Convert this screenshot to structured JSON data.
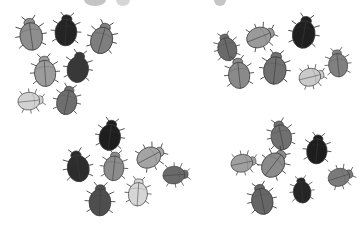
{
  "figure": {
    "background_color": "#ffffff",
    "width": 359,
    "height": 225,
    "outline_color": "#3a3a3a",
    "shade_palette": {
      "near_black": "#1c1c1c",
      "very_dark": "#2e2e2e",
      "dark": "#4a4a4a",
      "mid_dark": "#5f5f5f",
      "mid": "#767676",
      "mid_light": "#8e8e8e",
      "light": "#a9a9a9",
      "very_light": "#c4c4c4",
      "pale": "#dcdcdc",
      "near_white": "#ececec"
    }
  },
  "clusters": [
    {
      "name": "top-left-cluster",
      "label": "Cluster A",
      "count": 7,
      "origin": {
        "x": 0,
        "y": 0
      },
      "beetles": [
        {
          "id": "a1",
          "x": 14,
          "y": 16,
          "w": 34,
          "h": 38,
          "rot": -8,
          "shade": "#8e8e8e"
        },
        {
          "id": "a2",
          "x": 50,
          "y": 12,
          "w": 32,
          "h": 38,
          "rot": 4,
          "shade": "#242424"
        },
        {
          "id": "a3",
          "x": 86,
          "y": 20,
          "w": 32,
          "h": 38,
          "rot": 16,
          "shade": "#7e7e7e"
        },
        {
          "id": "a4",
          "x": 28,
          "y": 54,
          "w": 34,
          "h": 36,
          "rot": -4,
          "shade": "#9c9c9c"
        },
        {
          "id": "a5",
          "x": 62,
          "y": 50,
          "w": 32,
          "h": 36,
          "rot": 8,
          "shade": "#383838"
        },
        {
          "id": "a6",
          "x": 10,
          "y": 86,
          "w": 40,
          "h": 30,
          "rot": 84,
          "shade": "#d2d2d2"
        },
        {
          "id": "a7",
          "x": 52,
          "y": 84,
          "w": 30,
          "h": 34,
          "rot": 12,
          "shade": "#6e6e6e"
        }
      ]
    },
    {
      "name": "top-right-cluster",
      "label": "Cluster B",
      "count": 7,
      "origin": {
        "x": 205,
        "y": 0
      },
      "beetles": [
        {
          "id": "b1",
          "x": 212,
          "y": 32,
          "w": 30,
          "h": 32,
          "rot": -14,
          "shade": "#6a6a6a"
        },
        {
          "id": "b2",
          "x": 242,
          "y": 20,
          "w": 36,
          "h": 34,
          "rot": 68,
          "shade": "#9a9a9a"
        },
        {
          "id": "b3",
          "x": 286,
          "y": 14,
          "w": 36,
          "h": 38,
          "rot": 10,
          "shade": "#1f1f1f"
        },
        {
          "id": "b4",
          "x": 222,
          "y": 56,
          "w": 34,
          "h": 36,
          "rot": -6,
          "shade": "#8a8a8a"
        },
        {
          "id": "b5",
          "x": 258,
          "y": 50,
          "w": 34,
          "h": 38,
          "rot": 6,
          "shade": "#707070"
        },
        {
          "id": "b6",
          "x": 294,
          "y": 62,
          "w": 34,
          "h": 30,
          "rot": 76,
          "shade": "#cacaca"
        },
        {
          "id": "b7",
          "x": 324,
          "y": 44,
          "w": 28,
          "h": 40,
          "rot": -6,
          "shade": "#808080"
        }
      ]
    },
    {
      "name": "bottom-left-cluster",
      "label": "Cluster C",
      "count": 7,
      "origin": {
        "x": 55,
        "y": 112
      },
      "beetles": [
        {
          "id": "c1",
          "x": 94,
          "y": 118,
          "w": 32,
          "h": 36,
          "rot": 8,
          "shade": "#1e1e1e"
        },
        {
          "id": "c2",
          "x": 62,
          "y": 148,
          "w": 32,
          "h": 38,
          "rot": -10,
          "shade": "#2c2c2c"
        },
        {
          "id": "c3",
          "x": 98,
          "y": 150,
          "w": 32,
          "h": 34,
          "rot": 6,
          "shade": "#8c8c8c"
        },
        {
          "id": "c4",
          "x": 132,
          "y": 140,
          "w": 36,
          "h": 34,
          "rot": 62,
          "shade": "#a4a4a4"
        },
        {
          "id": "c5",
          "x": 158,
          "y": 160,
          "w": 34,
          "h": 30,
          "rot": 86,
          "shade": "#6a6a6a"
        },
        {
          "id": "c6",
          "x": 124,
          "y": 176,
          "w": 28,
          "h": 34,
          "rot": 4,
          "shade": "#d6d6d6"
        },
        {
          "id": "c7",
          "x": 84,
          "y": 182,
          "w": 32,
          "h": 38,
          "rot": 2,
          "shade": "#4e4e4e"
        }
      ]
    },
    {
      "name": "bottom-right-cluster",
      "label": "Cluster D",
      "count": 7,
      "origin": {
        "x": 215,
        "y": 112
      },
      "beetles": [
        {
          "id": "d1",
          "x": 266,
          "y": 118,
          "w": 30,
          "h": 36,
          "rot": -12,
          "shade": "#707070"
        },
        {
          "id": "d2",
          "x": 302,
          "y": 132,
          "w": 30,
          "h": 36,
          "rot": 6,
          "shade": "#1d1d1d"
        },
        {
          "id": "d3",
          "x": 226,
          "y": 148,
          "w": 34,
          "h": 30,
          "rot": 78,
          "shade": "#a0a0a0"
        },
        {
          "id": "d4",
          "x": 256,
          "y": 146,
          "w": 36,
          "h": 36,
          "rot": 38,
          "shade": "#8a8a8a"
        },
        {
          "id": "d5",
          "x": 322,
          "y": 162,
          "w": 36,
          "h": 30,
          "rot": 72,
          "shade": "#7a7a7a"
        },
        {
          "id": "d6",
          "x": 288,
          "y": 176,
          "w": 28,
          "h": 30,
          "rot": -6,
          "shade": "#252525"
        },
        {
          "id": "d7",
          "x": 246,
          "y": 182,
          "w": 32,
          "h": 36,
          "rot": -12,
          "shade": "#666666"
        }
      ]
    }
  ],
  "edge_fragments": [
    {
      "name": "top-fragment-left",
      "x": 84,
      "y": -6,
      "w": 22,
      "h": 12,
      "shade": "#555555"
    },
    {
      "name": "top-fragment-right",
      "x": 116,
      "y": -6,
      "w": 14,
      "h": 12,
      "shade": "#8a8a8a"
    },
    {
      "name": "top-fragment-far",
      "x": 214,
      "y": -6,
      "w": 12,
      "h": 12,
      "shade": "#5a5a5a"
    }
  ]
}
